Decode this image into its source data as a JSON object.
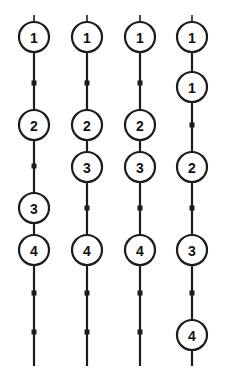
{
  "diagram": {
    "type": "node-chain-columns",
    "canvas": {
      "width": 229,
      "height": 374,
      "background": "#ffffff"
    },
    "style": {
      "line_color": "#1c1c1c",
      "node_fill": "#ffffff",
      "node_stroke": "#1c1c1c",
      "label_color": "#111111",
      "marker_color": "#1c1c1c",
      "node_radius": 15,
      "marker_size": 5,
      "line_width": 2.2
    },
    "columns": [
      {
        "id": "column-1",
        "cx": 34,
        "line_top": 15,
        "line_bottom": 366,
        "nodes": [
          {
            "label": "1",
            "cy": 37
          },
          {
            "label": "2",
            "cy": 125
          },
          {
            "label": "3",
            "cy": 208
          },
          {
            "label": "4",
            "cy": 250
          }
        ],
        "markers": [
          {
            "cy": 83
          },
          {
            "cy": 166
          },
          {
            "cy": 293
          },
          {
            "cy": 332
          }
        ]
      },
      {
        "id": "column-2",
        "cx": 87,
        "line_top": 15,
        "line_bottom": 366,
        "nodes": [
          {
            "label": "1",
            "cy": 37
          },
          {
            "label": "2",
            "cy": 125
          },
          {
            "label": "3",
            "cy": 167
          },
          {
            "label": "4",
            "cy": 250
          }
        ],
        "markers": [
          {
            "cy": 83
          },
          {
            "cy": 208
          },
          {
            "cy": 293
          },
          {
            "cy": 332
          }
        ]
      },
      {
        "id": "column-3",
        "cx": 140,
        "line_top": 15,
        "line_bottom": 366,
        "nodes": [
          {
            "label": "1",
            "cy": 37
          },
          {
            "label": "2",
            "cy": 125
          },
          {
            "label": "3",
            "cy": 167
          },
          {
            "label": "4",
            "cy": 250
          }
        ],
        "markers": [
          {
            "cy": 83
          },
          {
            "cy": 208
          },
          {
            "cy": 293
          },
          {
            "cy": 332
          }
        ]
      },
      {
        "id": "column-4",
        "cx": 192,
        "line_top": 15,
        "line_bottom": 366,
        "nodes": [
          {
            "label": "1",
            "cy": 37
          },
          {
            "label": "1",
            "cy": 87
          },
          {
            "label": "2",
            "cy": 167
          },
          {
            "label": "3",
            "cy": 250
          },
          {
            "label": "4",
            "cy": 335
          }
        ],
        "markers": [
          {
            "cy": 125
          },
          {
            "cy": 208
          },
          {
            "cy": 293
          }
        ]
      }
    ]
  }
}
